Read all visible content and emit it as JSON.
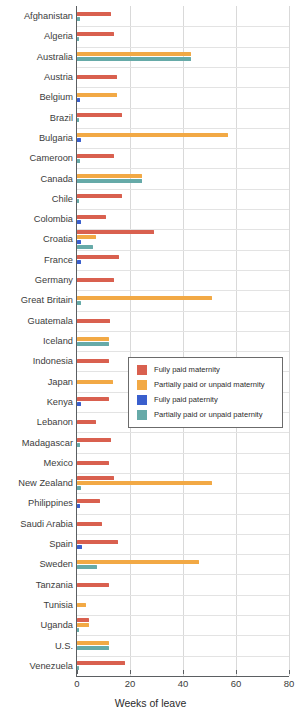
{
  "chart_data": {
    "type": "bar",
    "orientation": "horizontal",
    "title": "",
    "xlabel": "Weeks of leave",
    "ylabel": "",
    "xlim": [
      0,
      80
    ],
    "xticks": [
      0,
      20,
      40,
      60,
      80
    ],
    "grid": true,
    "legend_position": "center-right",
    "categories": [
      "Afghanistan",
      "Algeria",
      "Australia",
      "Austria",
      "Belgium",
      "Brazil",
      "Bulgaria",
      "Cameroon",
      "Canada",
      "Chile",
      "Colombia",
      "Croatia",
      "France",
      "Germany",
      "Great Britain",
      "Guatemala",
      "Iceland",
      "Indonesia",
      "Japan",
      "Kenya",
      "Lebanon",
      "Madagascar",
      "Mexico",
      "New Zealand",
      "Philippines",
      "Saudi Arabia",
      "Spain",
      "Sweden",
      "Tanzania",
      "Tunisia",
      "Uganda",
      "U.S.",
      "Venezuela"
    ],
    "series": [
      {
        "name": "Fully paid maternity",
        "color": "#d9604f",
        "values": [
          13,
          14,
          0,
          15,
          0,
          17,
          0,
          14,
          0,
          17,
          11,
          29,
          16,
          14,
          0,
          12.5,
          0,
          12,
          0,
          12,
          7,
          13,
          12,
          14,
          8.5,
          9.5,
          15.5,
          0,
          12,
          0,
          4.5,
          0,
          18
        ]
      },
      {
        "name": "Partially paid or unpaid maternity",
        "color": "#f2a945",
        "values": [
          0,
          0,
          43,
          0,
          15,
          0,
          57,
          0,
          24.5,
          0,
          0,
          7,
          0,
          0,
          51,
          0,
          12,
          0,
          13.5,
          0,
          0,
          0,
          0,
          51,
          0,
          0,
          0,
          46,
          0,
          3.5,
          4.5,
          12,
          0
        ]
      },
      {
        "name": "Fully paid paternity",
        "color": "#3a5fcd",
        "values": [
          0,
          0,
          0,
          0,
          1,
          0,
          1.5,
          0,
          0,
          0,
          1.5,
          1.5,
          1.5,
          0,
          0,
          0,
          0,
          0,
          0,
          1.5,
          0,
          0,
          0,
          0,
          1,
          0,
          2,
          0,
          0,
          0,
          0,
          0,
          0
        ]
      },
      {
        "name": "Partially paid or unpaid paternity",
        "color": "#66aaa8",
        "values": [
          1,
          0.8,
          43,
          0,
          0,
          0.8,
          0,
          1,
          24.5,
          0.8,
          0,
          6,
          0,
          0,
          1.5,
          0,
          12,
          0,
          0,
          0,
          0,
          1,
          0,
          1.5,
          0,
          0,
          0,
          7.5,
          0,
          0,
          0.8,
          12,
          0.8
        ]
      }
    ]
  },
  "axis": {
    "x_title": "Weeks of leave",
    "tick_labels": [
      "0",
      "20",
      "40",
      "60",
      "80"
    ]
  },
  "legend": {
    "items": [
      {
        "label": "Fully paid maternity",
        "color": "#d9604f"
      },
      {
        "label": "Partially paid or unpaid maternity",
        "color": "#f2a945"
      },
      {
        "label": "Fully paid paternity",
        "color": "#3a5fcd"
      },
      {
        "label": "Partially paid or unpaid paternity",
        "color": "#66aaa8"
      }
    ]
  }
}
